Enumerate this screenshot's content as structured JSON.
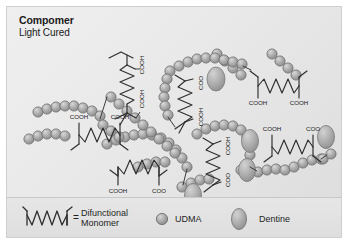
{
  "figure": {
    "title_main": "Compomer",
    "title_sub": "Light Cured",
    "background_color": "#e9e9e9",
    "border_color": "#cfcfcf",
    "bead_color": "#a8a8a8",
    "bead_outline": "#6e6e6e",
    "dentine_color": "#b0b0b0",
    "line_color": "#3a3a3a"
  },
  "legend": {
    "equals_sign": "=",
    "items": [
      {
        "symbol": "zigzag-monomer-icon",
        "label": "Difunctional\nMonomer"
      },
      {
        "symbol": "udma-bead-icon",
        "label": "UDMA"
      },
      {
        "symbol": "dentine-oval-icon",
        "label": "Dentine"
      }
    ]
  },
  "annotations": {
    "monomers": [
      {
        "id": "monomer-1",
        "orientation": "vertical",
        "labels": [
          "COOH",
          "COOH"
        ]
      },
      {
        "id": "monomer-2",
        "orientation": "vertical",
        "labels": [
          "COO",
          "COOH"
        ]
      },
      {
        "id": "monomer-3",
        "orientation": "horizontal",
        "labels": [
          "COOH",
          "COOH"
        ]
      },
      {
        "id": "monomer-4",
        "orientation": "horizontal",
        "labels": [
          "COOH",
          "COOH"
        ]
      },
      {
        "id": "monomer-5",
        "orientation": "vertical",
        "labels": [
          "COOH",
          "COO"
        ]
      },
      {
        "id": "monomer-6",
        "orientation": "horizontal",
        "labels": [
          "COOH",
          "COO"
        ]
      },
      {
        "id": "monomer-7",
        "orientation": "horizontal",
        "labels": [
          "COOH",
          "COO"
        ]
      }
    ],
    "label_cooh": "COOH",
    "label_coo": "COO"
  }
}
